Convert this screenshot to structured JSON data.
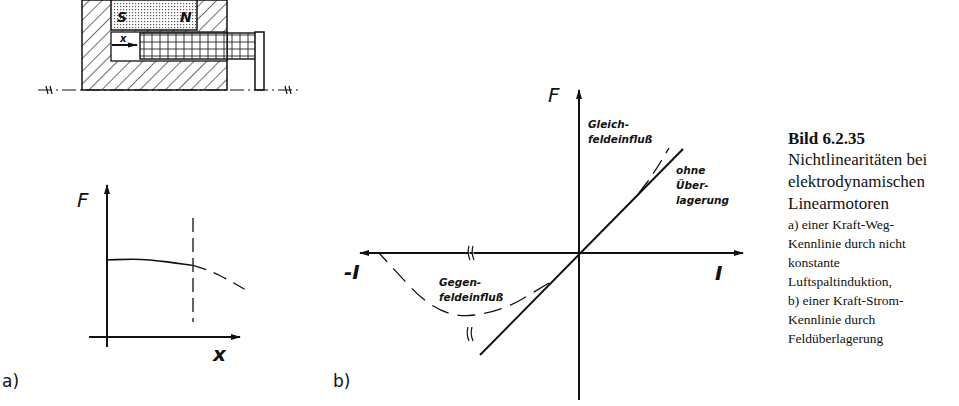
{
  "figure": {
    "caption": {
      "title": "Bild 6.2.35",
      "main_lines": [
        "Nichtlinearitäten bei",
        "elektrodynamischen",
        "Linearmotoren"
      ],
      "sub_lines": [
        "a) einer Kraft-Weg-",
        "Kennlinie durch nicht",
        "konstante",
        "Luftspaltinduktion,",
        "b) einer Kraft-Strom-",
        "Kennlinie durch",
        "Feldüberlagerung"
      ]
    },
    "motor_sketch": {
      "magnet_south": "S",
      "magnet_north": "N",
      "displacement_label": "x"
    },
    "panel_a": {
      "label": "a)",
      "y_axis": "F",
      "x_axis": "x"
    },
    "panel_b": {
      "label": "b)",
      "y_axis": "F",
      "x_axis_pos": "I",
      "x_axis_neg": "-I",
      "annotations": {
        "gleich_1": "Gleich-",
        "gleich_2": "feldeinfluß",
        "ohne_1": "ohne",
        "ohne_2": "Über-",
        "ohne_3": "lagerung",
        "gegen_1": "Gegen-",
        "gegen_2": "feldeinfluß"
      }
    }
  },
  "chart_data": [
    {
      "type": "line",
      "title": "a) Kraft-Weg-Kennlinie",
      "xlabel": "x",
      "ylabel": "F",
      "series": [
        {
          "name": "F(x) measured range",
          "style": "solid",
          "x": [
            0,
            0.2,
            0.4,
            0.6,
            0.8,
            1.0
          ],
          "y": [
            1.0,
            1.01,
            1.01,
            0.99,
            0.96,
            0.93
          ]
        },
        {
          "name": "F(x) beyond limit",
          "style": "dashed",
          "x": [
            1.0,
            1.2,
            1.4,
            1.6
          ],
          "y": [
            0.93,
            0.86,
            0.75,
            0.62
          ]
        }
      ],
      "markers": [
        {
          "type": "vertical-dashed-line",
          "x": 1.0
        }
      ],
      "grid": false
    },
    {
      "type": "line",
      "title": "b) Kraft-Strom-Kennlinie",
      "xlabel": "I",
      "ylabel": "F",
      "series": [
        {
          "name": "ohne Überlagerung",
          "style": "solid",
          "x": [
            -1,
            0,
            1
          ],
          "y": [
            -1,
            0,
            1
          ]
        },
        {
          "name": "Gleichfeldeinfluß",
          "style": "dashed",
          "x": [
            0.6,
            0.75,
            0.9
          ],
          "y": [
            0.6,
            0.8,
            1.05
          ]
        },
        {
          "name": "Gegenfeldeinfluß",
          "style": "dashed",
          "x": [
            -0.3,
            -0.8,
            -1.4,
            -2.0
          ],
          "y": [
            -0.3,
            -0.6,
            -0.65,
            0
          ]
        }
      ],
      "grid": false
    }
  ]
}
